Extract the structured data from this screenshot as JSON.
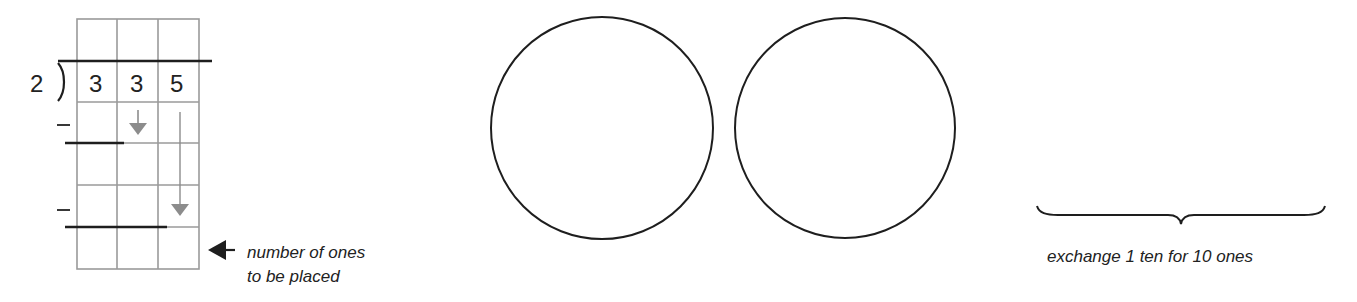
{
  "division": {
    "divisor": "2",
    "dividend_digits": [
      "3",
      "3",
      "5"
    ],
    "minus_signs": [
      "–",
      "–"
    ],
    "grid": {
      "columns": 3,
      "rows": 6
    },
    "arrow_note": "number of ones to be placed",
    "arrow_note_lines": [
      "number of ones",
      "to be placed"
    ]
  },
  "circles": [
    {
      "id": "circle-1"
    },
    {
      "id": "circle-2"
    }
  ],
  "brace": {
    "label": "exchange 1 ten for 10 ones"
  },
  "colors": {
    "ink": "#222222",
    "grid": "#9a9a9a",
    "arrow_gray": "#8c8c8c"
  }
}
